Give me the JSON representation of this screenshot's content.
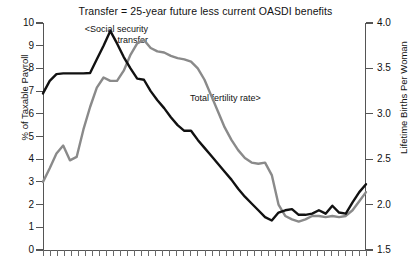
{
  "chart_data": {
    "type": "line",
    "title": "Transfer = 25-year future less current OASDI benefits",
    "xlabel": "",
    "ylabel": "% of Taxable Payroll",
    "y2label": "Lifetime Births Per Woman",
    "ylim": [
      0,
      10
    ],
    "y2lim": [
      1.5,
      4.0
    ],
    "yticks": [
      "0",
      "1",
      "2",
      "3",
      "4",
      "5",
      "6",
      "7",
      "8",
      "9",
      "10"
    ],
    "y2ticks": [
      "1.5",
      "2.0",
      "2.5",
      "3.0",
      "3.5",
      "4.0"
    ],
    "grid": false,
    "legend_position": "inline-annotations",
    "xtick_count": 47,
    "xtick_labels": [],
    "annotations": [
      {
        "text_line1": "<Social security",
        "text_line2": "transfer",
        "series": "social-security-transfer"
      },
      {
        "text": "Total fertility rate>",
        "series": "total-fertility-rate"
      }
    ],
    "series": [
      {
        "name": "Social security transfer",
        "axis": "left",
        "color": "#111111",
        "unit": "% of Taxable Payroll",
        "values": [
          6.9,
          7.45,
          7.75,
          7.78,
          7.78,
          7.78,
          7.78,
          7.8,
          8.4,
          9.0,
          9.65,
          9.1,
          8.5,
          8.0,
          7.55,
          7.5,
          7.0,
          6.6,
          6.25,
          5.85,
          5.5,
          5.25,
          5.25,
          4.85,
          4.5,
          4.15,
          3.8,
          3.45,
          3.1,
          2.7,
          2.35,
          2.05,
          1.75,
          1.45,
          1.3,
          1.65,
          1.75,
          1.8,
          1.55,
          1.55,
          1.6,
          1.75,
          1.6,
          1.95,
          1.65,
          1.6,
          2.1,
          2.55,
          2.9
        ]
      },
      {
        "name": "Total fertility rate",
        "axis": "right",
        "color": "#8a8a8a",
        "unit": "Lifetime Births Per Woman",
        "values_left_scale": [
          3.0,
          3.6,
          4.25,
          4.6,
          3.95,
          4.1,
          5.3,
          6.3,
          7.15,
          7.6,
          7.45,
          7.45,
          7.9,
          8.6,
          9.1,
          9.25,
          8.9,
          8.75,
          8.7,
          8.55,
          8.45,
          8.4,
          8.3,
          8.0,
          7.5,
          6.8,
          6.1,
          5.4,
          4.85,
          4.4,
          4.05,
          3.85,
          3.8,
          3.85,
          3.3,
          2.0,
          1.5,
          1.35,
          1.25,
          1.35,
          1.5,
          1.5,
          1.45,
          1.5,
          1.45,
          1.5,
          1.75,
          2.15,
          2.55
        ],
        "values": [
          2.25,
          2.4,
          2.56,
          2.65,
          2.49,
          2.53,
          2.83,
          3.08,
          3.29,
          3.4,
          3.36,
          3.36,
          3.48,
          3.65,
          3.78,
          3.81,
          3.73,
          3.69,
          3.68,
          3.64,
          3.61,
          3.6,
          3.58,
          3.5,
          3.38,
          3.2,
          3.03,
          2.85,
          2.71,
          2.6,
          2.51,
          2.46,
          2.45,
          2.46,
          2.33,
          2.0,
          1.88,
          1.84,
          1.81,
          1.84,
          1.88,
          1.88,
          1.86,
          1.88,
          1.86,
          1.88,
          1.94,
          2.04,
          2.14
        ]
      }
    ]
  }
}
